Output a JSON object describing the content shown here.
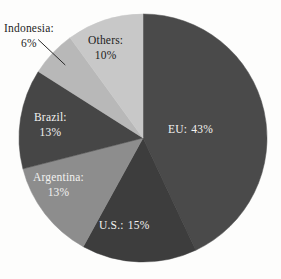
{
  "chart_data": {
    "type": "pie",
    "title": "",
    "subtitle": "",
    "xlabel": "",
    "ylabel": "",
    "legend_position": "none",
    "grid": false,
    "units": "percent",
    "categories": [
      "EU",
      "U.S.",
      "Argentina",
      "Brazil",
      "Indonesia",
      "Others"
    ],
    "values": [
      43,
      15,
      13,
      13,
      6,
      10
    ],
    "start_angle_deg": 0,
    "direction": "clockwise",
    "slices": [
      {
        "name": "EU",
        "label_name": "EU:",
        "label_value": "43%",
        "label_text": "EU: 43%",
        "value": 43,
        "color": "#4a4a4a",
        "label_color": "#f2f2f0",
        "label_placement": "inside",
        "label_layout": "inline",
        "start_angle_deg": 0,
        "end_angle_deg": 154.8,
        "leader_line": false
      },
      {
        "name": "U.S.",
        "label_name": "U.S.:",
        "label_value": "15%",
        "label_text": "U.S.: 15%",
        "value": 15,
        "color": "#3d3d3d",
        "label_color": "#f2f2f0",
        "label_placement": "inside",
        "label_layout": "inline",
        "start_angle_deg": 154.8,
        "end_angle_deg": 208.8,
        "leader_line": false
      },
      {
        "name": "Argentina",
        "label_name": "Argentina:",
        "label_value": "13%",
        "label_text": "Argentina: 13%",
        "value": 13,
        "color": "#8d8d8d",
        "label_color": "#f2f2f0",
        "label_placement": "inside",
        "label_layout": "stacked",
        "start_angle_deg": 208.8,
        "end_angle_deg": 255.6,
        "leader_line": false
      },
      {
        "name": "Brazil",
        "label_name": "Brazil:",
        "label_value": "13%",
        "label_text": "Brazil: 13%",
        "value": 13,
        "color": "#464646",
        "label_color": "#f2f2f0",
        "label_placement": "inside",
        "label_layout": "stacked",
        "start_angle_deg": 255.6,
        "end_angle_deg": 302.4,
        "leader_line": false
      },
      {
        "name": "Indonesia",
        "label_name": "Indonesia:",
        "label_value": "6%",
        "label_text": "Indonesia: 6%",
        "value": 6,
        "color": "#b8b8b8",
        "label_color": "#1d1d1d",
        "label_placement": "outside",
        "label_layout": "stacked",
        "start_angle_deg": 302.4,
        "end_angle_deg": 324.0,
        "leader_line": true
      },
      {
        "name": "Others",
        "label_name": "Others:",
        "label_value": "10%",
        "label_text": "Others: 10%",
        "value": 10,
        "color": "#c8c8c8",
        "label_color": "#1d1d1d",
        "label_placement": "inside",
        "label_layout": "stacked",
        "start_angle_deg": 324.0,
        "end_angle_deg": 360.0,
        "leader_line": false
      }
    ],
    "geometry": {
      "center_x": 143,
      "center_y": 138,
      "radius": 124
    },
    "background_color": "#fdfdfc"
  }
}
